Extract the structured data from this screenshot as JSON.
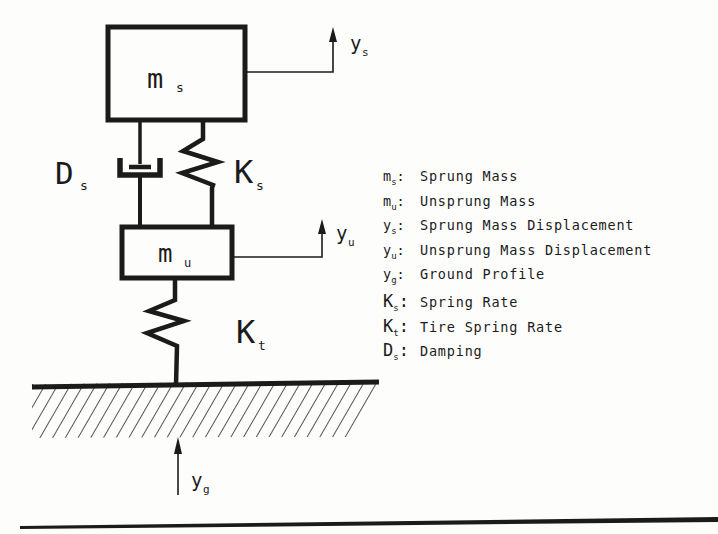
{
  "colors": {
    "ink": "#1b1b1b",
    "paper": "#fdfdfc"
  },
  "diagram": {
    "sprung_mass_label": {
      "main": "m",
      "sub": "s"
    },
    "unsprung_mass_label": {
      "main": "m",
      "sub": "u"
    },
    "ys_label": {
      "main": "y",
      "sub": "s"
    },
    "yu_label": {
      "main": "y",
      "sub": "u"
    },
    "yg_label": {
      "main": "y",
      "sub": "g"
    },
    "ks_label": {
      "main": "K",
      "sub": "s"
    },
    "kt_label": {
      "main": "K",
      "sub": "t"
    },
    "ds_label": {
      "main": "D",
      "sub": "s"
    }
  },
  "legend": {
    "sep": ":",
    "items": [
      {
        "sym": "m",
        "sub": "s",
        "desc": "Sprung Mass"
      },
      {
        "sym": "m",
        "sub": "u",
        "desc": "Unsprung Mass"
      },
      {
        "sym": "y",
        "sub": "s",
        "desc": "Sprung Mass Displacement"
      },
      {
        "sym": "y",
        "sub": "u",
        "desc": "Unsprung Mass Displacement"
      },
      {
        "sym": "y",
        "sub": "g",
        "desc": "Ground Profile"
      },
      {
        "sym": "K",
        "sub": "s",
        "desc": "Spring Rate"
      },
      {
        "sym": "K",
        "sub": "t",
        "desc": "Tire Spring Rate"
      },
      {
        "sym": "D",
        "sub": "s",
        "desc": "Damping"
      }
    ]
  }
}
